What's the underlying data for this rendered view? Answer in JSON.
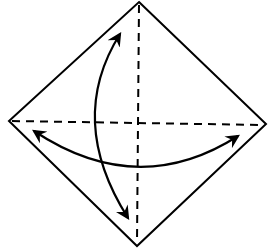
{
  "diagram": {
    "type": "origami-fold-diagram",
    "colors": {
      "line": "#000000",
      "background": "#ffffff"
    },
    "square": {
      "top": [
        139,
        2
      ],
      "right": [
        266,
        124
      ],
      "bottom": [
        137,
        246
      ],
      "left": [
        9,
        121
      ]
    },
    "fold_lines": [
      {
        "name": "vertical-diagonal",
        "style": "dashed"
      },
      {
        "name": "horizontal-diagonal",
        "style": "dashed"
      }
    ],
    "arrows": [
      {
        "name": "vertical-fold-unfold-arrow",
        "type": "double-headed-curved"
      },
      {
        "name": "horizontal-fold-unfold-arrow",
        "type": "double-headed-curved"
      }
    ]
  }
}
